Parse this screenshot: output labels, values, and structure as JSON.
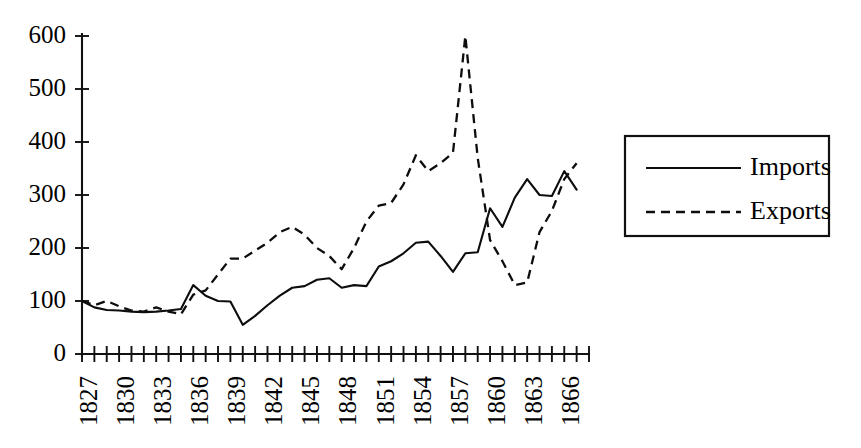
{
  "chart_data": {
    "type": "line",
    "title": "",
    "subtitle": "",
    "xlabel": "",
    "ylabel": "",
    "xlim": [
      1827,
      1868
    ],
    "ylim": [
      0,
      600
    ],
    "grid": false,
    "legend_position": "right-outside",
    "y_ticks": [
      0,
      100,
      200,
      300,
      400,
      500,
      600
    ],
    "y_tick_labels": [
      "0",
      "100",
      "200",
      "300",
      "400",
      "500",
      "600"
    ],
    "x_tick_labels_shown": [
      "1827",
      "1830",
      "1833",
      "1836",
      "1839",
      "1842",
      "1845",
      "1848",
      "1851",
      "1854",
      "1857",
      "1860",
      "1863",
      "1866"
    ],
    "x_tick_label_rotation": -90,
    "x_tick_label_interval_years": 3,
    "x_all_years": [
      1827,
      1828,
      1829,
      1830,
      1831,
      1832,
      1833,
      1834,
      1835,
      1836,
      1837,
      1838,
      1839,
      1840,
      1841,
      1842,
      1843,
      1844,
      1845,
      1846,
      1847,
      1848,
      1849,
      1850,
      1851,
      1852,
      1853,
      1854,
      1855,
      1856,
      1857,
      1858,
      1859,
      1860,
      1861,
      1862,
      1863,
      1864,
      1865,
      1866,
      1867,
      1868
    ],
    "series": [
      {
        "name": "Imports",
        "style": "solid",
        "color": "#0d0d0d",
        "x": [
          1827,
          1828,
          1829,
          1830,
          1831,
          1832,
          1833,
          1834,
          1835,
          1836,
          1837,
          1838,
          1839,
          1840,
          1841,
          1842,
          1843,
          1844,
          1845,
          1846,
          1847,
          1848,
          1849,
          1850,
          1851,
          1852,
          1853,
          1854,
          1855,
          1856,
          1857,
          1858,
          1859,
          1860,
          1861,
          1862,
          1863,
          1864,
          1865,
          1866,
          1867
        ],
        "values": [
          100,
          88,
          83,
          82,
          80,
          79,
          80,
          82,
          85,
          130,
          110,
          100,
          99,
          55,
          72,
          92,
          110,
          125,
          128,
          140,
          143,
          125,
          130,
          128,
          165,
          175,
          190,
          210,
          212,
          185,
          155,
          190,
          192,
          275,
          240,
          295,
          330,
          300,
          298,
          345,
          310
        ]
      },
      {
        "name": "Exports",
        "style": "dashed",
        "color": "#0d0d0d",
        "x": [
          1827,
          1828,
          1829,
          1830,
          1831,
          1832,
          1833,
          1834,
          1835,
          1836,
          1837,
          1838,
          1839,
          1840,
          1841,
          1842,
          1843,
          1844,
          1845,
          1846,
          1847,
          1848,
          1849,
          1850,
          1851,
          1852,
          1853,
          1854,
          1855,
          1856,
          1857,
          1858,
          1859,
          1860,
          1861,
          1862,
          1863,
          1864,
          1865,
          1866,
          1867
        ],
        "values": [
          100,
          92,
          100,
          90,
          82,
          80,
          88,
          80,
          75,
          112,
          120,
          150,
          180,
          180,
          195,
          210,
          230,
          240,
          225,
          200,
          185,
          160,
          200,
          250,
          280,
          285,
          320,
          375,
          345,
          360,
          380,
          600,
          370,
          215,
          175,
          130,
          135,
          230,
          270,
          330,
          360
        ]
      }
    ]
  },
  "legend": {
    "entries": [
      {
        "label": "Imports",
        "style": "solid"
      },
      {
        "label": "Exports",
        "style": "dashed"
      }
    ]
  }
}
